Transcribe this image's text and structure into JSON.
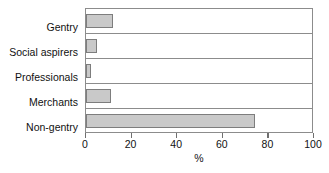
{
  "chart_data": {
    "type": "bar",
    "orientation": "horizontal",
    "title": "",
    "xlabel": "%",
    "ylabel": "",
    "categories": [
      "Gentry",
      "Social aspirers",
      "Professionals",
      "Merchants",
      "Non-gentry"
    ],
    "values": [
      12,
      5,
      2,
      11,
      74
    ],
    "xlim": [
      0,
      100
    ],
    "xticks": [
      0,
      20,
      40,
      60,
      80,
      100
    ],
    "xtick_labels": [
      "0",
      "20",
      "40",
      "60",
      "80",
      "100"
    ],
    "grid": false,
    "legend": null,
    "colors": {
      "bar_fill": "#c9c9c9",
      "bar_border": "#7d7d7d",
      "frame": "#8c8c8c",
      "text": "#111111",
      "background": "#ffffff"
    }
  }
}
